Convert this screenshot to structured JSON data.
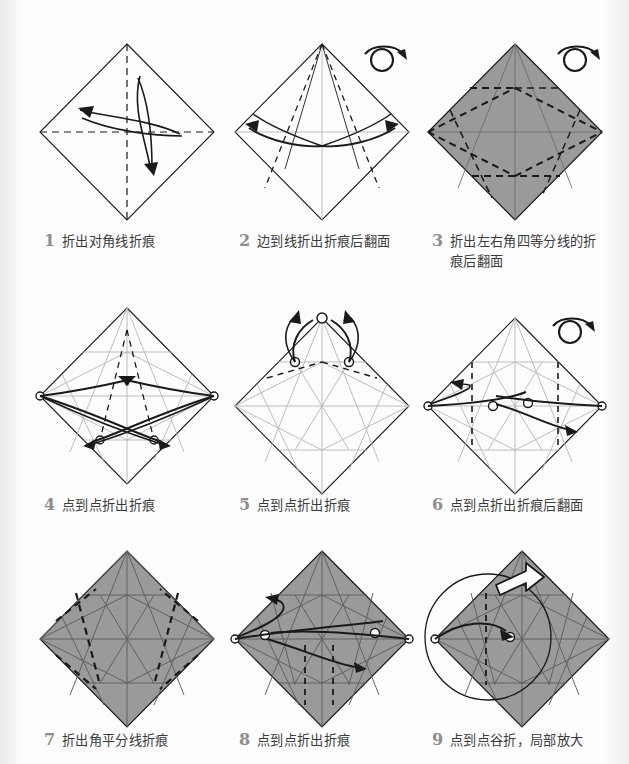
{
  "page": {
    "kind": "origami-instruction-sheet",
    "background_color": "#fdfdfd",
    "paper_gray": "#9a9a9a",
    "line_color": "#1a1a1a",
    "ghost_crease_color": "#b4b4b4"
  },
  "steps": [
    {
      "number": "1",
      "text": "折出对角线折痕",
      "shaded": false,
      "turn_over": false,
      "magnify": false
    },
    {
      "number": "2",
      "text": "边到线折出折痕后翻面",
      "shaded": false,
      "turn_over": true,
      "magnify": false
    },
    {
      "number": "3",
      "text": "折出左右角四等分线的折痕后翻面",
      "shaded": true,
      "turn_over": true,
      "magnify": false
    },
    {
      "number": "4",
      "text": "点到点折出折痕",
      "shaded": false,
      "turn_over": false,
      "magnify": false
    },
    {
      "number": "5",
      "text": "点到点折出折痕",
      "shaded": false,
      "turn_over": false,
      "magnify": false
    },
    {
      "number": "6",
      "text": "点到点折出折痕后翻面",
      "shaded": false,
      "turn_over": true,
      "magnify": false
    },
    {
      "number": "7",
      "text": "折出角平分线折痕",
      "shaded": true,
      "turn_over": false,
      "magnify": false
    },
    {
      "number": "8",
      "text": "点到点折出折痕",
      "shaded": true,
      "turn_over": false,
      "magnify": false
    },
    {
      "number": "9",
      "text": "点到点谷折，局部放大",
      "shaded": true,
      "turn_over": false,
      "magnify": true
    }
  ],
  "icons": {
    "turn_over": "turn-over-icon",
    "magnify": "magnify-circle-icon",
    "hollow_arrow": "hollow-push-arrow-icon"
  }
}
